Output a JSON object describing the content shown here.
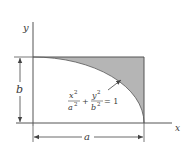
{
  "diagram": {
    "axes": {
      "x_label": "x",
      "y_label": "y"
    },
    "dimensions": {
      "height_label": "b",
      "width_label": "a"
    },
    "equation": {
      "term1_num": "x",
      "term1_den": "a",
      "term2_num": "y",
      "term2_den": "b",
      "exp": "2",
      "plus": "+",
      "equals": "= 1"
    },
    "colors": {
      "shaded_region": "#b5b5b5",
      "lines": "#555555",
      "text": "#3a3a3a"
    }
  }
}
